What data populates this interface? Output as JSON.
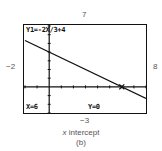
{
  "chart_data": {
    "type": "line",
    "title": "x intercept",
    "subtitle": "(b)",
    "equation": "Y1=-2X/3+4",
    "series": [
      {
        "name": "Y1",
        "x": [
          -2,
          8
        ],
        "y": [
          5.3333,
          -1.3333
        ]
      }
    ],
    "trace_point": {
      "x": 6,
      "y": 0
    },
    "window": {
      "xmin": -2,
      "xmax": 8,
      "ymin": -3,
      "ymax": 7,
      "xscl": 1,
      "yscl": 1
    },
    "xlim": [
      -2,
      8
    ],
    "ylim": [
      -3,
      7
    ],
    "grid": false
  },
  "window_labels": {
    "ymax": "7",
    "xmin": "−2",
    "xmax": "8",
    "ymin": "−3"
  },
  "screen": {
    "equation_text": "Y1=-2X/3+4",
    "x_readout": "X=6",
    "y_readout": "Y=0"
  },
  "caption": {
    "title": "x intercept",
    "label": "(b)"
  }
}
